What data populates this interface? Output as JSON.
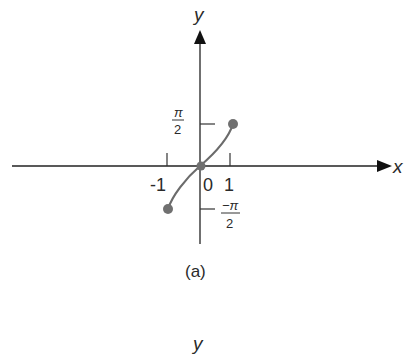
{
  "figure": {
    "caption": "(a)",
    "y_axis_label": "y",
    "x_axis_label": "x",
    "second_figure_y_label": "y",
    "x_ticks": [
      {
        "label": "-1",
        "value": -1
      },
      {
        "label": "0",
        "value": 0
      },
      {
        "label": "1",
        "value": 1
      }
    ],
    "y_ticks": [
      {
        "num": "π",
        "den": "2",
        "value": "π/2"
      },
      {
        "num": "−π",
        "den": "2",
        "value": "-π/2"
      }
    ],
    "curve": "y = arcsin(x) style curve from (-1, -π/2) through (0,0) to (1, π/2)",
    "points": [
      {
        "x": -1,
        "y": "-π/2"
      },
      {
        "x": 0,
        "y": 0
      },
      {
        "x": 1,
        "y": "π/2"
      }
    ],
    "colors": {
      "axis": "#222222",
      "curve": "#6b6b6b",
      "point": "#707070"
    }
  }
}
